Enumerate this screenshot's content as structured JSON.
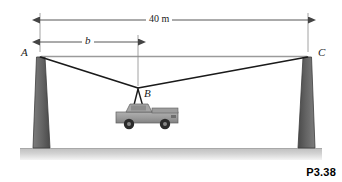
{
  "figure": {
    "caption": "P3.38",
    "type": "statics-free-body-diagram"
  },
  "points": [
    {
      "id": "A",
      "label": "A",
      "x": 40,
      "y": 57,
      "role": "left-cable-anchor"
    },
    {
      "id": "B",
      "label": "B",
      "x": 138,
      "y": 88,
      "role": "load-attachment-point"
    },
    {
      "id": "C",
      "label": "C",
      "x": 308,
      "y": 57,
      "role": "right-cable-anchor"
    }
  ],
  "dimensions": [
    {
      "id": "span-total",
      "label": "40 m",
      "value": 40,
      "unit": "m",
      "from": "A",
      "to": "C",
      "line_y": 20,
      "x_start": 40,
      "x_end": 308,
      "italic": false
    },
    {
      "id": "span-b",
      "label": "b",
      "value": null,
      "unit": "m",
      "from": "A",
      "to": "B",
      "line_y": 42,
      "x_start": 40,
      "x_end": 138,
      "italic": true
    }
  ],
  "members": [
    {
      "id": "cable-AB",
      "from": "A",
      "to": "B",
      "kind": "cable"
    },
    {
      "id": "cable-BC",
      "from": "B",
      "to": "C",
      "kind": "cable"
    },
    {
      "id": "reference-line-AC",
      "from": "A",
      "to": "C",
      "kind": "reference"
    },
    {
      "id": "sling-left",
      "from": "B",
      "to": "truck-bed-left",
      "kind": "sling"
    },
    {
      "id": "sling-right",
      "from": "B",
      "to": "truck-bed-right",
      "kind": "sling"
    }
  ],
  "towers": [
    {
      "id": "tower-left",
      "side": "left",
      "top_x": 40,
      "top_y": 57,
      "base_y": 148
    },
    {
      "id": "tower-right",
      "side": "right",
      "top_x": 308,
      "top_y": 57,
      "base_y": 148
    }
  ],
  "load": {
    "id": "truck",
    "name": "pickup-truck",
    "center_x": 148,
    "center_y": 120
  },
  "ground": {
    "id": "ground-strip",
    "top_y": 148,
    "bottom_y": 160
  },
  "colors": {
    "line": "#1a1a1a",
    "reference_line": "#9a9a9a",
    "dimension_line": "#555555",
    "tower_fill": "#6f6f6f",
    "tower_edge": "#3c3c3c",
    "ground": "#c9c9c9",
    "truck_body": "#9d9d9d",
    "truck_shade": "#7c7c7c",
    "wheel": "#2b2b2b",
    "background": "#ffffff"
  }
}
